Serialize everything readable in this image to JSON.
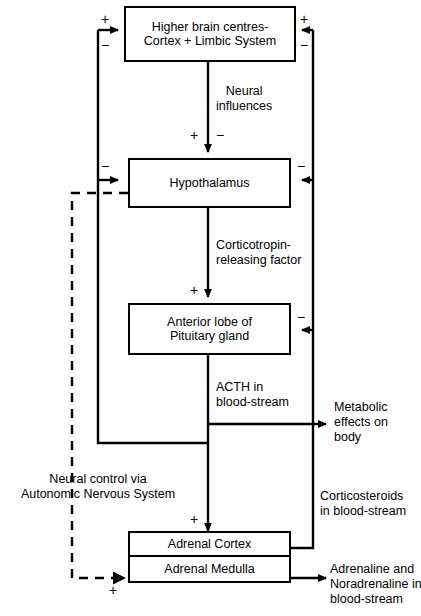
{
  "diagram": {
    "boxes": {
      "higher_brain": {
        "line1": "Higher brain centres-",
        "line2": "Cortex + Limbic System"
      },
      "hypothalamus": {
        "line1": "Hypothalamus"
      },
      "pituitary": {
        "line1": "Anterior lobe of",
        "line2": "Pituitary gland"
      },
      "adrenal_cortex": {
        "line1": "Adrenal Cortex"
      },
      "adrenal_medulla": {
        "line1": "Adrenal Medulla"
      }
    },
    "labels": {
      "neural_influences": {
        "line1": "Neural",
        "line2": "influences"
      },
      "crf": {
        "line1": "Corticotropin-",
        "line2": "releasing factor"
      },
      "acth": {
        "line1": "ACTH in",
        "line2": "blood-stream"
      },
      "metabolic": {
        "line1": "Metabolic",
        "line2": "effects on",
        "line3": "body"
      },
      "corticosteroids": {
        "line1": "Corticosteroids",
        "line2": "in blood-stream"
      },
      "adrenaline": {
        "line1": "Adrenaline and",
        "line2": "Noradrenaline in",
        "line3": "blood-stream"
      },
      "neural_control": {
        "line1": "Neural control via",
        "line2": "Autonomic Nervous System"
      }
    },
    "signs": {
      "top_left_plus": "+",
      "top_left_minus": "−",
      "top_right_plus": "+",
      "top_right_minus": "−",
      "neural_plus": "+",
      "neural_minus": "−",
      "hypo_left_minus": "−",
      "hypo_right_minus": "−",
      "crf_plus": "+",
      "pituitary_right_minus": "−",
      "adrenal_top_plus": "+",
      "medulla_left_plus": "+"
    },
    "colors": {
      "stroke": "#000000",
      "background": "#ffffff"
    }
  }
}
